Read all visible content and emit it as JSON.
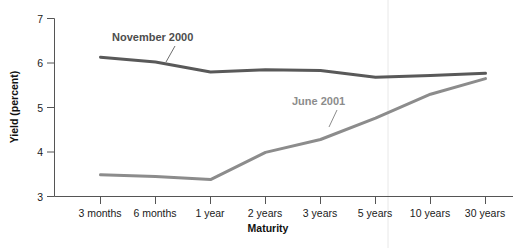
{
  "chart_data": {
    "type": "line",
    "title": "",
    "xlabel": "Maturity",
    "ylabel": "Yield (percent)",
    "categories": [
      "3 months",
      "6 months",
      "1 year",
      "2 years",
      "3 years",
      "5 years",
      "10 years",
      "30 years"
    ],
    "ylim": [
      3,
      7
    ],
    "yticks": [
      3,
      4,
      5,
      6,
      7
    ],
    "ytick_labels": [
      "3",
      "4",
      "5",
      "6",
      "7"
    ],
    "grid": false,
    "legend": "inline-annotations",
    "series": [
      {
        "name": "November 2000",
        "color": "#595959",
        "values": [
          6.13,
          6.02,
          5.8,
          5.85,
          5.83,
          5.68,
          5.72,
          5.77
        ]
      },
      {
        "name": "June 2001",
        "color": "#8c8c8c",
        "values": [
          3.49,
          3.45,
          3.38,
          3.99,
          4.28,
          4.76,
          5.3,
          5.65
        ]
      }
    ],
    "annotations": [
      {
        "text": "November 2000",
        "series": "November 2000",
        "color": "#4d4d4d"
      },
      {
        "text": "June 2001",
        "series": "June 2001",
        "color": "#8c8c8c"
      }
    ]
  },
  "axis": {
    "y_title": "Yield (percent)",
    "x_title": "Maturity",
    "y_tick_labels": [
      "7",
      "6",
      "5",
      "4",
      "3"
    ],
    "x_tick_labels": [
      "3 months",
      "6 months",
      "1 year",
      "2 years",
      "3 years",
      "5 years",
      "10 years",
      "30 years"
    ]
  },
  "colors": {
    "axis": "#555555",
    "series_november": "#595959",
    "series_june": "#8c8c8c",
    "text": "#1a1a1a",
    "background": "#ffffff",
    "divider": "#e0e0e0"
  }
}
